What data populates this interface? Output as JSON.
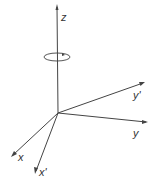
{
  "diagram": {
    "type": "coordinate-axes-rotation",
    "axes": {
      "z": {
        "label": "z"
      },
      "x": {
        "label": "x"
      },
      "x_prime": {
        "label": "x'"
      },
      "y": {
        "label": "y"
      },
      "y_prime": {
        "label": "y'"
      }
    },
    "rotation_indicator": "rotation about z-axis",
    "colors": {
      "line": "#444444",
      "background": "#ffffff"
    }
  }
}
